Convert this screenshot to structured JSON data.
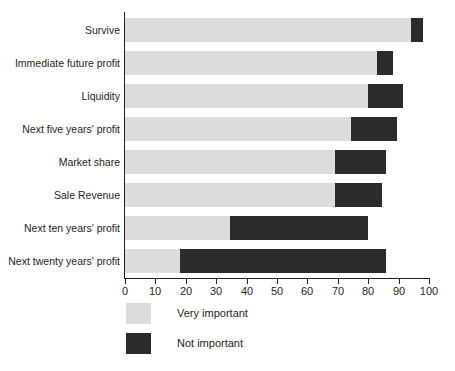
{
  "chart_data": {
    "type": "bar",
    "orientation": "horizontal",
    "stacked": true,
    "title": "",
    "subtitle": "",
    "xlabel": "",
    "ylabel": "",
    "xlim": [
      0,
      100
    ],
    "xticks": [
      0,
      10,
      20,
      30,
      40,
      50,
      60,
      70,
      80,
      90,
      100
    ],
    "xtick_labels": [
      "0",
      "10",
      "20",
      "30",
      "40",
      "50",
      "60",
      "70",
      "80",
      "90",
      "100"
    ],
    "grid": false,
    "legend_position": "bottom-left",
    "categories": [
      "Survive",
      "Immediate future profit",
      "Liquidity",
      "Next five years' profit",
      "Market share",
      "Sale Revenue",
      "Next ten years' profit",
      "Next twenty years' profit"
    ],
    "series": [
      {
        "name": "Very important",
        "color": "#dcdcdc",
        "values": [
          94,
          83,
          80,
          74.5,
          69,
          69,
          34.5,
          18
        ]
      },
      {
        "name": "Not important",
        "color": "#2b2b2b",
        "values": [
          4,
          5,
          11.5,
          15,
          17,
          15.5,
          45.5,
          68
        ]
      }
    ],
    "cumulative_totals": [
      98,
      88,
      91.5,
      89.5,
      86,
      84.5,
      80,
      86
    ]
  },
  "legend": {
    "items": [
      {
        "label": "Very important",
        "color": "#dcdcdc"
      },
      {
        "label": "Not important",
        "color": "#2b2b2b"
      }
    ]
  }
}
